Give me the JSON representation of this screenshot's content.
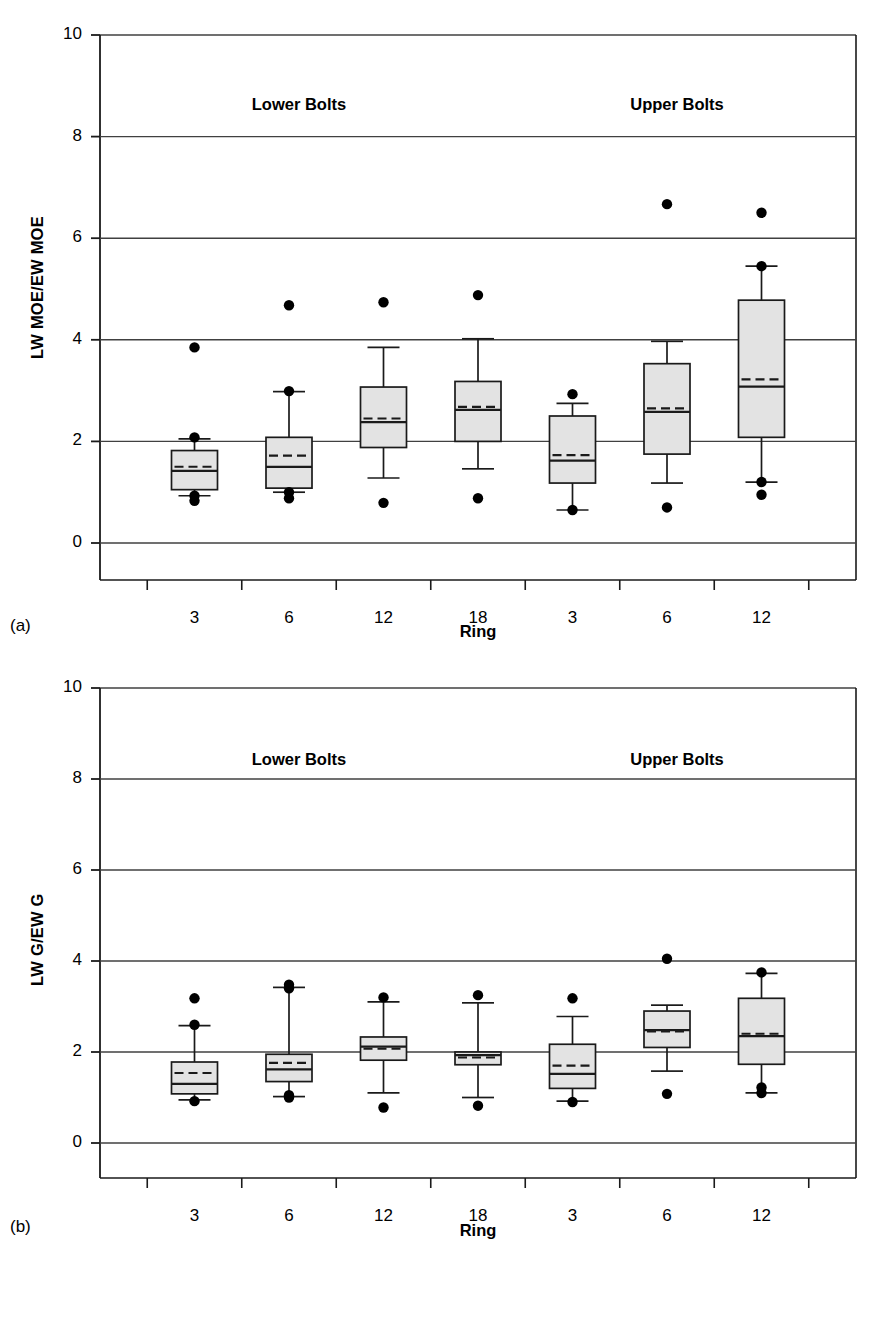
{
  "figure": {
    "panels": [
      {
        "tag": "(a)",
        "ylabel": "LW MOE/EW MOE",
        "xlabel": "Ring",
        "group_labels": [
          "Lower Bolts",
          "Upper Bolts"
        ]
      },
      {
        "tag": "(b)",
        "ylabel": "LW G/EW G",
        "xlabel": "Ring",
        "group_labels": [
          "Lower Bolts",
          "Upper Bolts"
        ]
      }
    ]
  },
  "style": {
    "box_fill": "#e3e3e3",
    "line_color": "#1a1a1a",
    "grid_color": "#404040",
    "point_color": "#000000"
  },
  "chart_data": [
    {
      "type": "box",
      "panel": "a",
      "title": "",
      "xlabel": "Ring",
      "ylabel": "LW MOE/EW MOE",
      "ylim": [
        -1.1,
        10
      ],
      "yticks": [
        0,
        2,
        4,
        6,
        8,
        10
      ],
      "ytick_labels": [
        "0",
        "2",
        "4",
        "6",
        "8",
        "10"
      ],
      "grid": "horizontal",
      "categories": [
        "3",
        "6",
        "12",
        "18",
        "3",
        "6",
        "12"
      ],
      "groups": [
        {
          "label": "Lower Bolts",
          "categories": [
            "3",
            "6",
            "12",
            "18"
          ]
        },
        {
          "label": "Upper Bolts",
          "categories": [
            "3",
            "6",
            "12"
          ]
        }
      ],
      "boxes": [
        {
          "category": "3",
          "group": "Lower Bolts",
          "whisker_low": 0.93,
          "q1": 1.05,
          "median": 1.42,
          "mean": 1.5,
          "q3": 1.82,
          "whisker_high": 2.05,
          "outliers": [
            3.85,
            2.08,
            0.93,
            0.83
          ]
        },
        {
          "category": "6",
          "group": "Lower Bolts",
          "whisker_low": 1.0,
          "q1": 1.08,
          "median": 1.5,
          "mean": 1.72,
          "q3": 2.08,
          "whisker_high": 2.98,
          "outliers": [
            4.68,
            2.99,
            1.0,
            0.88
          ]
        },
        {
          "category": "12",
          "group": "Lower Bolts",
          "whisker_low": 1.28,
          "q1": 1.88,
          "median": 2.38,
          "mean": 2.45,
          "q3": 3.07,
          "whisker_high": 3.85,
          "outliers": [
            4.74,
            0.79
          ]
        },
        {
          "category": "18",
          "group": "Lower Bolts",
          "whisker_low": 1.46,
          "q1": 2.0,
          "median": 2.62,
          "mean": 2.68,
          "q3": 3.18,
          "whisker_high": 4.02,
          "outliers": [
            4.88,
            0.88
          ]
        },
        {
          "category": "3",
          "group": "Upper Bolts",
          "whisker_low": 0.65,
          "q1": 1.18,
          "median": 1.62,
          "mean": 1.73,
          "q3": 2.5,
          "whisker_high": 2.75,
          "outliers": [
            2.93,
            0.65
          ]
        },
        {
          "category": "6",
          "group": "Upper Bolts",
          "whisker_low": 1.18,
          "q1": 1.75,
          "median": 2.58,
          "mean": 2.65,
          "q3": 3.53,
          "whisker_high": 3.97,
          "outliers": [
            6.67,
            0.7
          ]
        },
        {
          "category": "12",
          "group": "Upper Bolts",
          "whisker_low": 1.2,
          "q1": 2.08,
          "median": 3.08,
          "mean": 3.22,
          "q3": 4.78,
          "whisker_high": 5.45,
          "outliers": [
            6.5,
            5.45,
            1.2,
            0.95
          ]
        }
      ]
    },
    {
      "type": "box",
      "panel": "b",
      "title": "",
      "xlabel": "Ring",
      "ylabel": "LW G/EW G",
      "ylim": [
        -1.1,
        10
      ],
      "yticks": [
        0,
        2,
        4,
        6,
        8,
        10
      ],
      "ytick_labels": [
        "0",
        "2",
        "4",
        "6",
        "8",
        "10"
      ],
      "grid": "horizontal",
      "categories": [
        "3",
        "6",
        "12",
        "18",
        "3",
        "6",
        "12"
      ],
      "groups": [
        {
          "label": "Lower Bolts",
          "categories": [
            "3",
            "6",
            "12",
            "18"
          ]
        },
        {
          "label": "Upper Bolts",
          "categories": [
            "3",
            "6",
            "12"
          ]
        }
      ],
      "boxes": [
        {
          "category": "3",
          "group": "Lower Bolts",
          "whisker_low": 0.95,
          "q1": 1.08,
          "median": 1.3,
          "mean": 1.54,
          "q3": 1.78,
          "whisker_high": 2.58,
          "outliers": [
            3.18,
            2.6,
            0.92
          ]
        },
        {
          "category": "6",
          "group": "Lower Bolts",
          "whisker_low": 1.02,
          "q1": 1.35,
          "median": 1.62,
          "mean": 1.76,
          "q3": 1.95,
          "whisker_high": 3.42,
          "outliers": [
            3.48,
            3.4,
            1.05,
            1.0
          ]
        },
        {
          "category": "12",
          "group": "Lower Bolts",
          "whisker_low": 1.1,
          "q1": 1.82,
          "median": 2.12,
          "mean": 2.07,
          "q3": 2.33,
          "whisker_high": 3.1,
          "outliers": [
            3.2,
            0.78
          ]
        },
        {
          "category": "18",
          "group": "Lower Bolts",
          "whisker_low": 1.0,
          "q1": 1.72,
          "median": 1.93,
          "mean": 1.88,
          "q3": 2.0,
          "whisker_high": 3.08,
          "outliers": [
            3.25,
            0.82
          ]
        },
        {
          "category": "3",
          "group": "Upper Bolts",
          "whisker_low": 0.92,
          "q1": 1.2,
          "median": 1.52,
          "mean": 1.7,
          "q3": 2.17,
          "whisker_high": 2.78,
          "outliers": [
            3.18,
            0.9
          ]
        },
        {
          "category": "6",
          "group": "Upper Bolts",
          "whisker_low": 1.58,
          "q1": 2.1,
          "median": 2.48,
          "mean": 2.45,
          "q3": 2.9,
          "whisker_high": 3.03,
          "outliers": [
            4.05,
            1.08
          ]
        },
        {
          "category": "12",
          "group": "Upper Bolts",
          "whisker_low": 1.1,
          "q1": 1.73,
          "median": 2.35,
          "mean": 2.4,
          "q3": 3.18,
          "whisker_high": 3.73,
          "outliers": [
            3.75,
            1.22,
            1.1
          ]
        }
      ]
    }
  ]
}
